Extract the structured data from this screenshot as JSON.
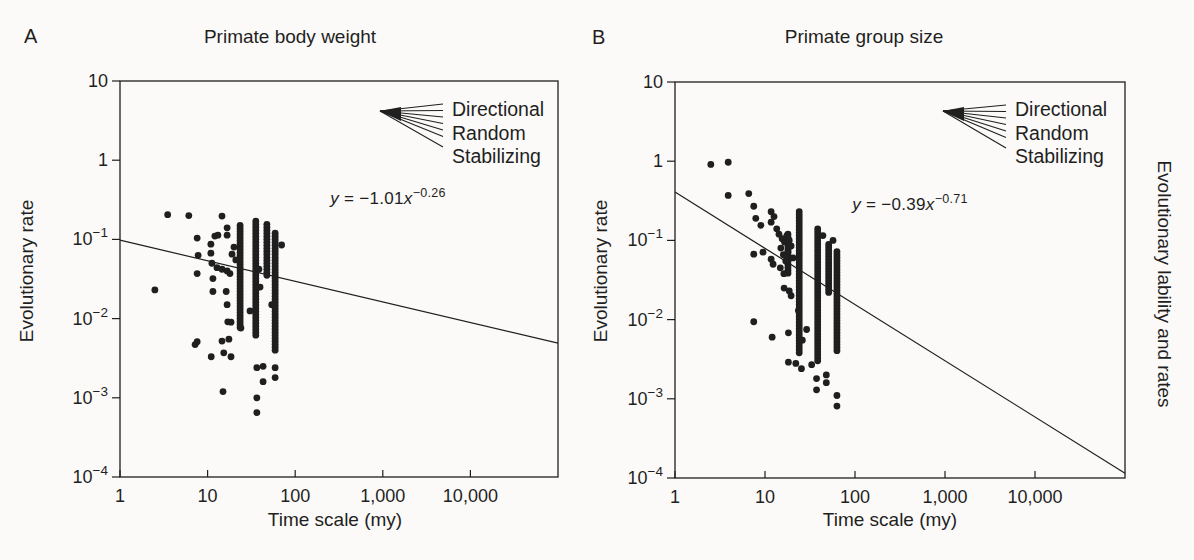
{
  "figure": {
    "background": "#fbfaf8",
    "ink": "#1f1f1f",
    "right_margin_label": "Evolutionary lability and rates"
  },
  "chart_data": [
    {
      "panel_letter": "A",
      "type": "scatter",
      "title": "Primate body weight",
      "xlabel": "Time scale (my)",
      "ylabel": "Evolutionary rate",
      "x_scale": "log",
      "y_scale": "log",
      "xlim": [
        1,
        100000
      ],
      "ylim": [
        0.0001,
        10
      ],
      "grid": "off",
      "x_ticks": [
        {
          "value": 1,
          "label": "1"
        },
        {
          "value": 10,
          "label": "10"
        },
        {
          "value": 100,
          "label": "100"
        },
        {
          "value": 1000,
          "label": "1,000"
        },
        {
          "value": 10000,
          "label": "10,000"
        }
      ],
      "y_ticks": [
        {
          "value": 10,
          "base": "10",
          "exp": ""
        },
        {
          "value": 1,
          "base": "1",
          "exp": ""
        },
        {
          "value": 0.1,
          "base": "10",
          "exp": "−1"
        },
        {
          "value": 0.01,
          "base": "10",
          "exp": "−2"
        },
        {
          "value": 0.001,
          "base": "10",
          "exp": "−3"
        },
        {
          "value": 0.0001,
          "base": "10",
          "exp": "−4"
        }
      ],
      "fit": {
        "lhs": "y",
        "mid": " = −1.01",
        "var": "x",
        "exponent": "−0.26",
        "log10_intercept": -1.01,
        "slope": -0.26
      },
      "legend_fan": {
        "labels": [
          "Directional",
          "Random",
          "Stabilizing"
        ]
      },
      "points": [
        [
          2.5,
          0.023
        ],
        [
          3.5,
          0.205
        ],
        [
          6.1,
          0.2
        ],
        [
          7.6,
          0.104
        ],
        [
          7.8,
          0.063
        ],
        [
          7.6,
          0.037
        ],
        [
          10.9,
          0.087
        ],
        [
          10.9,
          0.067
        ],
        [
          12.1,
          0.11
        ],
        [
          13.1,
          0.113
        ],
        [
          14.6,
          0.197
        ],
        [
          16.7,
          0.14
        ],
        [
          16.7,
          0.113
        ],
        [
          11.2,
          0.05
        ],
        [
          11.5,
          0.032
        ],
        [
          12.8,
          0.044
        ],
        [
          14.6,
          0.042
        ],
        [
          16.7,
          0.04
        ],
        [
          18,
          0.037
        ],
        [
          16.3,
          0.022
        ],
        [
          11.5,
          0.022
        ],
        [
          16.7,
          0.015
        ],
        [
          18.5,
          0.009
        ],
        [
          7.6,
          0.0051
        ],
        [
          11,
          0.0033
        ],
        [
          15.3,
          0.0037
        ],
        [
          18.5,
          0.0033
        ],
        [
          17,
          0.0091
        ],
        [
          17.5,
          0.0055
        ],
        [
          15,
          0.0012
        ],
        [
          24,
          0.0076
        ],
        [
          30.5,
          0.0125
        ],
        [
          36.5,
          0.0024
        ],
        [
          36.5,
          0.001
        ],
        [
          36.5,
          0.00065
        ],
        [
          43,
          0.0025
        ],
        [
          43,
          0.0016
        ],
        [
          59,
          0.0024
        ],
        [
          59,
          0.0018
        ],
        [
          54,
          0.015
        ],
        [
          14.6,
          0.0052
        ],
        [
          7.2,
          0.0047
        ],
        [
          20,
          0.08
        ],
        [
          21,
          0.055
        ],
        [
          19,
          0.065
        ],
        [
          70,
          0.085
        ],
        [
          38.5,
          0.042
        ],
        [
          39.7,
          0.025
        ]
      ],
      "columns": [
        {
          "x": 23.5,
          "y_top": 0.15,
          "y_bottom": 0.0075
        },
        {
          "x": 35.5,
          "y_top": 0.17,
          "y_bottom": 0.0058
        },
        {
          "x": 47.5,
          "y_top": 0.155,
          "y_bottom": 0.034
        },
        {
          "x": 59,
          "y_top": 0.12,
          "y_bottom": 0.0039
        }
      ]
    },
    {
      "panel_letter": "B",
      "type": "scatter",
      "title": "Primate group size",
      "xlabel": "Time scale (my)",
      "ylabel": "Evolutionary rate",
      "x_scale": "log",
      "y_scale": "log",
      "xlim": [
        1,
        100000
      ],
      "ylim": [
        0.0001,
        10
      ],
      "grid": "off",
      "x_ticks": [
        {
          "value": 1,
          "label": "1"
        },
        {
          "value": 10,
          "label": "10"
        },
        {
          "value": 100,
          "label": "100"
        },
        {
          "value": 1000,
          "label": "1,000"
        },
        {
          "value": 10000,
          "label": "10,000"
        }
      ],
      "y_ticks": [
        {
          "value": 10,
          "base": "10",
          "exp": ""
        },
        {
          "value": 1,
          "base": "1",
          "exp": ""
        },
        {
          "value": 0.1,
          "base": "10",
          "exp": "−1"
        },
        {
          "value": 0.01,
          "base": "10",
          "exp": "−2"
        },
        {
          "value": 0.001,
          "base": "10",
          "exp": "−3"
        },
        {
          "value": 0.0001,
          "base": "10",
          "exp": "−4"
        }
      ],
      "fit": {
        "lhs": "y",
        "mid": " = −0.39",
        "var": "x",
        "exponent": "−0.71",
        "log10_intercept": -0.39,
        "slope": -0.71
      },
      "legend_fan": {
        "labels": [
          "Directional",
          "Random",
          "Stabilizing"
        ]
      },
      "points": [
        [
          2.5,
          0.91
        ],
        [
          3.9,
          0.97
        ],
        [
          3.9,
          0.37
        ],
        [
          6.6,
          0.39
        ],
        [
          7.5,
          0.27
        ],
        [
          7.9,
          0.19
        ],
        [
          11.7,
          0.23
        ],
        [
          12.6,
          0.2
        ],
        [
          11.7,
          0.17
        ],
        [
          7.5,
          0.067
        ],
        [
          9.5,
          0.071
        ],
        [
          11.7,
          0.058
        ],
        [
          12.3,
          0.05
        ],
        [
          14.3,
          0.12
        ],
        [
          15.5,
          0.105
        ],
        [
          16.5,
          0.095
        ],
        [
          17.5,
          0.115
        ],
        [
          18.6,
          0.1
        ],
        [
          15,
          0.08
        ],
        [
          16,
          0.066
        ],
        [
          17,
          0.055
        ],
        [
          18,
          0.072
        ],
        [
          19.5,
          0.085
        ],
        [
          20.5,
          0.06
        ],
        [
          14.8,
          0.045
        ],
        [
          16.2,
          0.038
        ],
        [
          16.3,
          0.025
        ],
        [
          18.6,
          0.023
        ],
        [
          19.5,
          0.02
        ],
        [
          7.5,
          0.0094
        ],
        [
          12,
          0.006
        ],
        [
          18.2,
          0.0068
        ],
        [
          18.2,
          0.0029
        ],
        [
          23.5,
          0.013
        ],
        [
          22,
          0.0028
        ],
        [
          33,
          0.0027
        ],
        [
          48,
          0.002
        ],
        [
          48,
          0.0016
        ],
        [
          63,
          0.0011
        ],
        [
          63,
          0.00081
        ],
        [
          25.4,
          0.0024
        ],
        [
          37.4,
          0.0018
        ],
        [
          37.4,
          0.0013
        ],
        [
          13.5,
          0.14
        ],
        [
          9,
          0.155
        ],
        [
          44,
          0.115
        ],
        [
          57,
          0.1
        ],
        [
          29,
          0.0075
        ],
        [
          26,
          0.0055
        ]
      ],
      "columns": [
        {
          "x": 18,
          "y_top": 0.12,
          "y_bottom": 0.037
        },
        {
          "x": 24,
          "y_top": 0.23,
          "y_bottom": 0.0035
        },
        {
          "x": 38.5,
          "y_top": 0.14,
          "y_bottom": 0.0028
        },
        {
          "x": 51,
          "y_top": 0.089,
          "y_bottom": 0.021
        },
        {
          "x": 63,
          "y_top": 0.072,
          "y_bottom": 0.004
        }
      ]
    }
  ]
}
